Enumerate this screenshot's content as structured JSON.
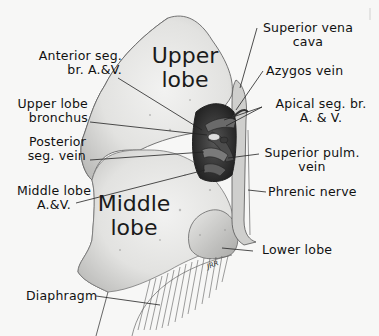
{
  "figure": {
    "regions": [
      {
        "id": "upper-lobe",
        "line1": "Upper",
        "line2": "lobe"
      },
      {
        "id": "middle-lobe",
        "line1": "Middle",
        "line2": "lobe"
      }
    ],
    "labels_left": [
      {
        "id": "anterior-seg",
        "line1": "Anterior seg.",
        "line2": "br. A.&V."
      },
      {
        "id": "upper-lobe-bronchus",
        "line1": "Upper lobe",
        "line2": "bronchus"
      },
      {
        "id": "posterior-seg-vein",
        "line1": "Posterior",
        "line2": "seg. vein"
      },
      {
        "id": "middle-lobe-av",
        "line1": "Middle lobe",
        "line2": "A.&V."
      },
      {
        "id": "diaphragm",
        "line1": "Diaphragm"
      }
    ],
    "labels_right": [
      {
        "id": "superior-vena-cava",
        "line1": "Superior  vena",
        "line2": "cava"
      },
      {
        "id": "azygos-vein",
        "line1": "Azygos  vein"
      },
      {
        "id": "apical-seg",
        "line1": "Apical seg. br.",
        "line2": "A. & V."
      },
      {
        "id": "superior-pulm-vein",
        "line1": "Superior  pulm.",
        "line2": "vein"
      },
      {
        "id": "phrenic-nerve",
        "line1": "Phrenic nerve"
      },
      {
        "id": "lower-lobe",
        "line1": "Lower lobe"
      }
    ],
    "signature": "JRR",
    "colors": {
      "background": "#f7f7f6",
      "ink": "#111111",
      "lung_fill": "#e4e4e2",
      "hilum_dark": "#2a2a2a",
      "vessel": "#5a5a5a"
    }
  }
}
